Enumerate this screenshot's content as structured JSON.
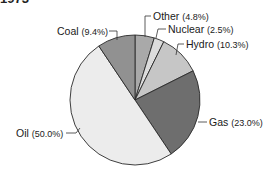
{
  "chart_data": {
    "type": "pie",
    "title": "1973",
    "start_angle": "12 o'clock",
    "direction": "clockwise",
    "slices": [
      {
        "label": "Other",
        "value": 4.8,
        "display": "(4.8%)",
        "color": "#a9a9a9"
      },
      {
        "label": "Nuclear",
        "value": 2.5,
        "display": "(2.5%)",
        "color": "#dcdcdc"
      },
      {
        "label": "Hydro",
        "value": 10.3,
        "display": "(10.3%)",
        "color": "#c6c6c6"
      },
      {
        "label": "Gas",
        "value": 23.0,
        "display": "(23.0%)",
        "color": "#6e6e6e"
      },
      {
        "label": "Oil",
        "value": 50.0,
        "display": "(50.0%)",
        "color": "#ececec"
      },
      {
        "label": "Coal",
        "value": 9.4,
        "display": "(9.4%)",
        "color": "#919191"
      }
    ],
    "categories": [
      "Other",
      "Nuclear",
      "Hydro",
      "Gas",
      "Oil",
      "Coal"
    ],
    "values": [
      4.8,
      2.5,
      10.3,
      23.0,
      50.0,
      9.4
    ],
    "legend": "none (leader-line labels)"
  }
}
